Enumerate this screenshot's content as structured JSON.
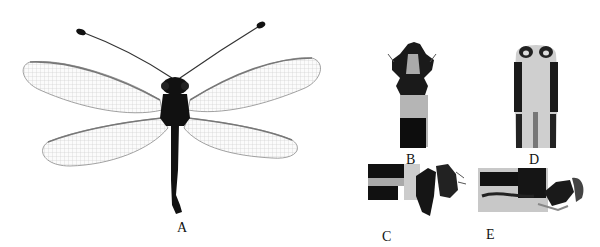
{
  "figure": {
    "panels": [
      {
        "id": "A",
        "label": "A",
        "subject": "adult-habitus-dorsal"
      },
      {
        "id": "B",
        "label": "B",
        "subject": "genitalia-dorsal"
      },
      {
        "id": "C",
        "label": "C",
        "subject": "genitalia-lateral"
      },
      {
        "id": "D",
        "label": "D",
        "subject": "genitalia-ventral"
      },
      {
        "id": "E",
        "label": "E",
        "subject": "genitalia-lateral-alt"
      }
    ]
  },
  "colors": {
    "background": "#ffffff",
    "specimen": "#111111",
    "wing": "#b8b8b8",
    "label": "#111111"
  }
}
